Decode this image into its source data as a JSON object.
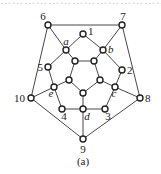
{
  "figure": {
    "caption": "(a)",
    "top_fragment": "……………………………………",
    "colors": {
      "stroke": "#222222",
      "node_fill": "#ffffff",
      "text": "#222222"
    },
    "nodes": [
      {
        "id": "6",
        "x": 48,
        "y": 25,
        "label": "6",
        "italic": false,
        "lx": 43,
        "ly": 20,
        "anchor": "middle"
      },
      {
        "id": "7",
        "x": 122,
        "y": 25,
        "label": "7",
        "italic": false,
        "lx": 123,
        "ly": 20,
        "anchor": "middle"
      },
      {
        "id": "1",
        "x": 83,
        "y": 34,
        "label": "1",
        "italic": false,
        "lx": 88,
        "ly": 35,
        "anchor": "start"
      },
      {
        "id": "a",
        "x": 66,
        "y": 50,
        "label": "a",
        "italic": true,
        "lx": 66,
        "ly": 45,
        "anchor": "middle"
      },
      {
        "id": "b",
        "x": 103,
        "y": 50,
        "label": "b",
        "italic": true,
        "lx": 108,
        "ly": 53,
        "anchor": "start"
      },
      {
        "id": "5",
        "x": 48,
        "y": 67,
        "label": "5",
        "italic": false,
        "lx": 43,
        "ly": 71,
        "anchor": "end"
      },
      {
        "id": "2",
        "x": 122,
        "y": 70,
        "label": "2",
        "italic": false,
        "lx": 127,
        "ly": 74,
        "anchor": "start"
      },
      {
        "id": "p1",
        "x": 75,
        "y": 61,
        "label": "",
        "italic": false
      },
      {
        "id": "p2",
        "x": 94,
        "y": 61,
        "label": "",
        "italic": false
      },
      {
        "id": "p3",
        "x": 100,
        "y": 80,
        "label": "",
        "italic": false
      },
      {
        "id": "p4",
        "x": 83,
        "y": 93,
        "label": "",
        "italic": false
      },
      {
        "id": "p5",
        "x": 69,
        "y": 80,
        "label": "",
        "italic": false
      },
      {
        "id": "e",
        "x": 54,
        "y": 87,
        "label": "e",
        "italic": true,
        "lx": 51,
        "ly": 97,
        "anchor": "middle"
      },
      {
        "id": "c",
        "x": 115,
        "y": 87,
        "label": "c",
        "italic": true,
        "lx": 114,
        "ly": 97,
        "anchor": "middle"
      },
      {
        "id": "10",
        "x": 31,
        "y": 98,
        "label": "10",
        "italic": false,
        "lx": 25,
        "ly": 102,
        "anchor": "end"
      },
      {
        "id": "8",
        "x": 140,
        "y": 98,
        "label": "8",
        "italic": false,
        "lx": 145,
        "ly": 102,
        "anchor": "start"
      },
      {
        "id": "4",
        "x": 62,
        "y": 109,
        "label": "4",
        "italic": false,
        "lx": 64,
        "ly": 120,
        "anchor": "middle"
      },
      {
        "id": "d",
        "x": 83,
        "y": 109,
        "label": "d",
        "italic": true,
        "lx": 87,
        "ly": 120,
        "anchor": "middle"
      },
      {
        "id": "3",
        "x": 105,
        "y": 109,
        "label": "3",
        "italic": false,
        "lx": 108,
        "ly": 120,
        "anchor": "middle"
      },
      {
        "id": "9",
        "x": 83,
        "y": 139,
        "label": "9",
        "italic": false,
        "lx": 83,
        "ly": 153,
        "anchor": "middle"
      }
    ],
    "edges": [
      [
        "6",
        "7"
      ],
      [
        "7",
        "8"
      ],
      [
        "8",
        "9"
      ],
      [
        "9",
        "10"
      ],
      [
        "10",
        "6"
      ],
      [
        "6",
        "a"
      ],
      [
        "7",
        "b"
      ],
      [
        "8",
        "c"
      ],
      [
        "9",
        "d"
      ],
      [
        "10",
        "e"
      ],
      [
        "a",
        "1"
      ],
      [
        "1",
        "b"
      ],
      [
        "b",
        "2"
      ],
      [
        "2",
        "c"
      ],
      [
        "c",
        "3"
      ],
      [
        "3",
        "d"
      ],
      [
        "d",
        "4"
      ],
      [
        "4",
        "e"
      ],
      [
        "e",
        "5"
      ],
      [
        "5",
        "a"
      ],
      [
        "p1",
        "p2"
      ],
      [
        "p2",
        "p3"
      ],
      [
        "p3",
        "p4"
      ],
      [
        "p4",
        "p5"
      ],
      [
        "p5",
        "p1"
      ],
      [
        "a",
        "p1"
      ],
      [
        "b",
        "p2"
      ],
      [
        "c",
        "p3"
      ],
      [
        "d",
        "p4"
      ],
      [
        "e",
        "p5"
      ]
    ]
  }
}
